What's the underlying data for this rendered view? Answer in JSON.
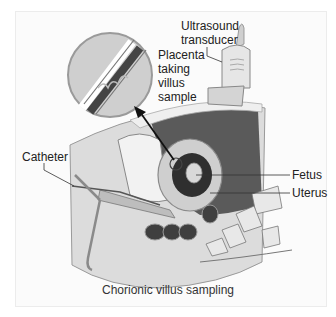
{
  "figure": {
    "caption": "Chorionic villus sampling",
    "labels": {
      "transducer_line1": "Ultrasound",
      "transducer_line2": "transducer",
      "placenta_line1": "Placenta",
      "placenta_line2": "taking",
      "placenta_line3": "villus",
      "placenta_line4": "sample",
      "catheter": "Catheter",
      "fetus": "Fetus",
      "uterus": "Uterus"
    },
    "colors": {
      "background": "#ffffff",
      "panel": "#fbfbfb",
      "skin": "#d9d9d9",
      "dark_cavity": "#555555",
      "text": "#222222"
    }
  }
}
